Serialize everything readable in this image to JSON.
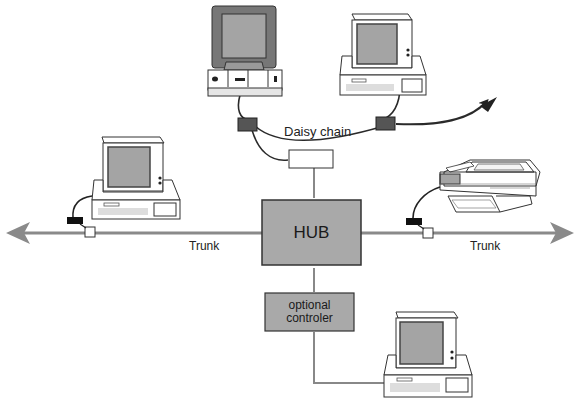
{
  "diagram": {
    "type": "network-topology",
    "labels": {
      "daisy_chain": "Daisy chain",
      "trunk_left": "Trunk",
      "trunk_right": "Trunk",
      "hub": "HUB",
      "controller_line1": "optional",
      "controller_line2": "controler"
    },
    "nodes": [
      {
        "id": "workstation-top-center",
        "kind": "desktop computer"
      },
      {
        "id": "workstation-top-right",
        "kind": "computer"
      },
      {
        "id": "workstation-left",
        "kind": "computer"
      },
      {
        "id": "printer-right",
        "kind": "laser printer"
      },
      {
        "id": "workstation-bottom-right",
        "kind": "computer"
      },
      {
        "id": "hub",
        "kind": "hub"
      },
      {
        "id": "optional-controller",
        "kind": "controller"
      },
      {
        "id": "daisy-chain-junction",
        "kind": "junction box"
      }
    ],
    "edges": [
      {
        "from": "workstation-top-center",
        "to": "daisy-chain-connector-left"
      },
      {
        "from": "workstation-top-right",
        "to": "daisy-chain-connector-right"
      },
      {
        "from": "daisy-chain-connector-left",
        "to": "daisy-chain-connector-right",
        "label": "Daisy chain"
      },
      {
        "from": "daisy-chain-connector-right",
        "to": "external",
        "arrow": true
      },
      {
        "from": "daisy-chain-connector-left",
        "to": "daisy-chain-junction"
      },
      {
        "from": "daisy-chain-junction",
        "to": "hub"
      },
      {
        "from": "hub",
        "to": "trunk-left",
        "label": "Trunk"
      },
      {
        "from": "hub",
        "to": "trunk-right",
        "label": "Trunk"
      },
      {
        "from": "workstation-left",
        "to": "trunk-left"
      },
      {
        "from": "printer-right",
        "to": "trunk-right"
      },
      {
        "from": "hub",
        "to": "optional-controller"
      },
      {
        "from": "optional-controller",
        "to": "workstation-bottom-right"
      }
    ],
    "colors": {
      "box_fill": "#a9a9a9",
      "trunk": "#8a8a8a",
      "screen": "#a4a4a4",
      "connector": "#555555",
      "outline": "#333333"
    }
  }
}
